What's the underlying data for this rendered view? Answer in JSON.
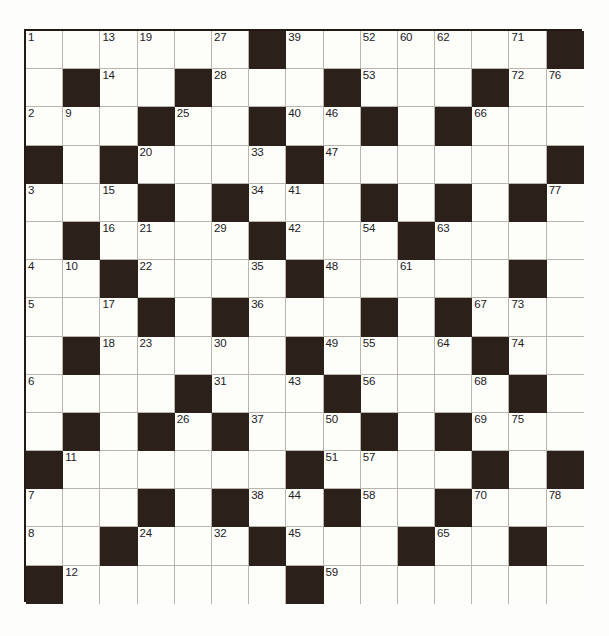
{
  "puzzle": {
    "type": "crossword-grid",
    "rows": 15,
    "columns": 15,
    "cell_size_px": 37,
    "colors": {
      "block": "#2b211a",
      "cell": "#fdfdfa",
      "grid_line": "#b9b4ac",
      "border": "#241a14",
      "number_text": "#23211f",
      "page_background": "#ffffff"
    },
    "number_range": {
      "min": 1,
      "max": 78
    },
    "grid": [
      [
        {
          "block": false,
          "number": "1"
        },
        {
          "block": false,
          "number": ""
        },
        {
          "block": false,
          "number": "13"
        },
        {
          "block": false,
          "number": "19"
        },
        {
          "block": false,
          "number": ""
        },
        {
          "block": false,
          "number": "27"
        },
        {
          "block": true,
          "number": ""
        },
        {
          "block": false,
          "number": "39"
        },
        {
          "block": false,
          "number": ""
        },
        {
          "block": false,
          "number": "52"
        },
        {
          "block": false,
          "number": "60"
        },
        {
          "block": false,
          "number": "62"
        },
        {
          "block": false,
          "number": ""
        },
        {
          "block": false,
          "number": "71"
        },
        {
          "block": true,
          "number": ""
        }
      ],
      [
        {
          "block": false,
          "number": ""
        },
        {
          "block": true,
          "number": ""
        },
        {
          "block": false,
          "number": "14"
        },
        {
          "block": false,
          "number": ""
        },
        {
          "block": true,
          "number": ""
        },
        {
          "block": false,
          "number": "28"
        },
        {
          "block": false,
          "number": ""
        },
        {
          "block": false,
          "number": ""
        },
        {
          "block": true,
          "number": ""
        },
        {
          "block": false,
          "number": "53"
        },
        {
          "block": false,
          "number": ""
        },
        {
          "block": false,
          "number": ""
        },
        {
          "block": true,
          "number": ""
        },
        {
          "block": false,
          "number": "72"
        },
        {
          "block": false,
          "number": "76"
        }
      ],
      [
        {
          "block": false,
          "number": "2"
        },
        {
          "block": false,
          "number": "9"
        },
        {
          "block": false,
          "number": ""
        },
        {
          "block": true,
          "number": ""
        },
        {
          "block": false,
          "number": "25"
        },
        {
          "block": false,
          "number": ""
        },
        {
          "block": true,
          "number": ""
        },
        {
          "block": false,
          "number": "40"
        },
        {
          "block": false,
          "number": "46"
        },
        {
          "block": true,
          "number": ""
        },
        {
          "block": false,
          "number": ""
        },
        {
          "block": true,
          "number": ""
        },
        {
          "block": false,
          "number": "66"
        },
        {
          "block": false,
          "number": ""
        },
        {
          "block": false,
          "number": ""
        }
      ],
      [
        {
          "block": true,
          "number": ""
        },
        {
          "block": false,
          "number": ""
        },
        {
          "block": true,
          "number": ""
        },
        {
          "block": false,
          "number": "20"
        },
        {
          "block": false,
          "number": ""
        },
        {
          "block": false,
          "number": ""
        },
        {
          "block": false,
          "number": "33"
        },
        {
          "block": true,
          "number": ""
        },
        {
          "block": false,
          "number": "47"
        },
        {
          "block": false,
          "number": ""
        },
        {
          "block": false,
          "number": ""
        },
        {
          "block": false,
          "number": ""
        },
        {
          "block": false,
          "number": ""
        },
        {
          "block": false,
          "number": ""
        },
        {
          "block": true,
          "number": ""
        }
      ],
      [
        {
          "block": false,
          "number": "3"
        },
        {
          "block": false,
          "number": ""
        },
        {
          "block": false,
          "number": "15"
        },
        {
          "block": true,
          "number": ""
        },
        {
          "block": false,
          "number": ""
        },
        {
          "block": true,
          "number": ""
        },
        {
          "block": false,
          "number": "34"
        },
        {
          "block": false,
          "number": "41"
        },
        {
          "block": false,
          "number": ""
        },
        {
          "block": true,
          "number": ""
        },
        {
          "block": false,
          "number": ""
        },
        {
          "block": true,
          "number": ""
        },
        {
          "block": false,
          "number": ""
        },
        {
          "block": true,
          "number": ""
        },
        {
          "block": false,
          "number": "77"
        }
      ],
      [
        {
          "block": false,
          "number": ""
        },
        {
          "block": true,
          "number": ""
        },
        {
          "block": false,
          "number": "16"
        },
        {
          "block": false,
          "number": "21"
        },
        {
          "block": false,
          "number": ""
        },
        {
          "block": false,
          "number": "29"
        },
        {
          "block": true,
          "number": ""
        },
        {
          "block": false,
          "number": "42"
        },
        {
          "block": false,
          "number": ""
        },
        {
          "block": false,
          "number": "54"
        },
        {
          "block": true,
          "number": ""
        },
        {
          "block": false,
          "number": "63"
        },
        {
          "block": false,
          "number": ""
        },
        {
          "block": false,
          "number": ""
        },
        {
          "block": false,
          "number": ""
        }
      ],
      [
        {
          "block": false,
          "number": "4"
        },
        {
          "block": false,
          "number": "10"
        },
        {
          "block": true,
          "number": ""
        },
        {
          "block": false,
          "number": "22"
        },
        {
          "block": false,
          "number": ""
        },
        {
          "block": false,
          "number": ""
        },
        {
          "block": false,
          "number": "35"
        },
        {
          "block": true,
          "number": ""
        },
        {
          "block": false,
          "number": "48"
        },
        {
          "block": false,
          "number": ""
        },
        {
          "block": false,
          "number": "61"
        },
        {
          "block": false,
          "number": ""
        },
        {
          "block": false,
          "number": ""
        },
        {
          "block": true,
          "number": ""
        },
        {
          "block": false,
          "number": ""
        }
      ],
      [
        {
          "block": false,
          "number": "5"
        },
        {
          "block": false,
          "number": ""
        },
        {
          "block": false,
          "number": "17"
        },
        {
          "block": true,
          "number": ""
        },
        {
          "block": false,
          "number": ""
        },
        {
          "block": true,
          "number": ""
        },
        {
          "block": false,
          "number": "36"
        },
        {
          "block": false,
          "number": ""
        },
        {
          "block": false,
          "number": ""
        },
        {
          "block": true,
          "number": ""
        },
        {
          "block": false,
          "number": ""
        },
        {
          "block": true,
          "number": ""
        },
        {
          "block": false,
          "number": "67"
        },
        {
          "block": false,
          "number": "73"
        },
        {
          "block": false,
          "number": ""
        }
      ],
      [
        {
          "block": false,
          "number": ""
        },
        {
          "block": true,
          "number": ""
        },
        {
          "block": false,
          "number": "18"
        },
        {
          "block": false,
          "number": "23"
        },
        {
          "block": false,
          "number": ""
        },
        {
          "block": false,
          "number": "30"
        },
        {
          "block": false,
          "number": ""
        },
        {
          "block": true,
          "number": ""
        },
        {
          "block": false,
          "number": "49"
        },
        {
          "block": false,
          "number": "55"
        },
        {
          "block": false,
          "number": ""
        },
        {
          "block": false,
          "number": "64"
        },
        {
          "block": true,
          "number": ""
        },
        {
          "block": false,
          "number": "74"
        },
        {
          "block": false,
          "number": ""
        }
      ],
      [
        {
          "block": false,
          "number": "6"
        },
        {
          "block": false,
          "number": ""
        },
        {
          "block": false,
          "number": ""
        },
        {
          "block": false,
          "number": ""
        },
        {
          "block": true,
          "number": ""
        },
        {
          "block": false,
          "number": "31"
        },
        {
          "block": false,
          "number": ""
        },
        {
          "block": false,
          "number": "43"
        },
        {
          "block": true,
          "number": ""
        },
        {
          "block": false,
          "number": "56"
        },
        {
          "block": false,
          "number": ""
        },
        {
          "block": false,
          "number": ""
        },
        {
          "block": false,
          "number": "68"
        },
        {
          "block": true,
          "number": ""
        },
        {
          "block": false,
          "number": ""
        }
      ],
      [
        {
          "block": false,
          "number": ""
        },
        {
          "block": true,
          "number": ""
        },
        {
          "block": false,
          "number": ""
        },
        {
          "block": true,
          "number": ""
        },
        {
          "block": false,
          "number": "26"
        },
        {
          "block": true,
          "number": ""
        },
        {
          "block": false,
          "number": "37"
        },
        {
          "block": false,
          "number": ""
        },
        {
          "block": false,
          "number": "50"
        },
        {
          "block": true,
          "number": ""
        },
        {
          "block": false,
          "number": ""
        },
        {
          "block": true,
          "number": ""
        },
        {
          "block": false,
          "number": "69"
        },
        {
          "block": false,
          "number": "75"
        },
        {
          "block": false,
          "number": ""
        }
      ],
      [
        {
          "block": true,
          "number": ""
        },
        {
          "block": false,
          "number": "11"
        },
        {
          "block": false,
          "number": ""
        },
        {
          "block": false,
          "number": ""
        },
        {
          "block": false,
          "number": ""
        },
        {
          "block": false,
          "number": ""
        },
        {
          "block": false,
          "number": ""
        },
        {
          "block": true,
          "number": ""
        },
        {
          "block": false,
          "number": "51"
        },
        {
          "block": false,
          "number": "57"
        },
        {
          "block": false,
          "number": ""
        },
        {
          "block": false,
          "number": ""
        },
        {
          "block": true,
          "number": ""
        },
        {
          "block": false,
          "number": ""
        },
        {
          "block": true,
          "number": ""
        }
      ],
      [
        {
          "block": false,
          "number": "7"
        },
        {
          "block": false,
          "number": ""
        },
        {
          "block": false,
          "number": ""
        },
        {
          "block": true,
          "number": ""
        },
        {
          "block": false,
          "number": ""
        },
        {
          "block": true,
          "number": ""
        },
        {
          "block": false,
          "number": "38"
        },
        {
          "block": false,
          "number": "44"
        },
        {
          "block": true,
          "number": ""
        },
        {
          "block": false,
          "number": "58"
        },
        {
          "block": false,
          "number": ""
        },
        {
          "block": true,
          "number": ""
        },
        {
          "block": false,
          "number": "70"
        },
        {
          "block": false,
          "number": ""
        },
        {
          "block": false,
          "number": "78"
        }
      ],
      [
        {
          "block": false,
          "number": "8"
        },
        {
          "block": false,
          "number": ""
        },
        {
          "block": true,
          "number": ""
        },
        {
          "block": false,
          "number": "24"
        },
        {
          "block": false,
          "number": ""
        },
        {
          "block": false,
          "number": "32"
        },
        {
          "block": true,
          "number": ""
        },
        {
          "block": false,
          "number": "45"
        },
        {
          "block": false,
          "number": ""
        },
        {
          "block": false,
          "number": ""
        },
        {
          "block": true,
          "number": ""
        },
        {
          "block": false,
          "number": "65"
        },
        {
          "block": false,
          "number": ""
        },
        {
          "block": true,
          "number": ""
        },
        {
          "block": false,
          "number": ""
        }
      ],
      [
        {
          "block": true,
          "number": ""
        },
        {
          "block": false,
          "number": "12"
        },
        {
          "block": false,
          "number": ""
        },
        {
          "block": false,
          "number": ""
        },
        {
          "block": false,
          "number": ""
        },
        {
          "block": false,
          "number": ""
        },
        {
          "block": false,
          "number": ""
        },
        {
          "block": true,
          "number": ""
        },
        {
          "block": false,
          "number": "59"
        },
        {
          "block": false,
          "number": ""
        },
        {
          "block": false,
          "number": ""
        },
        {
          "block": false,
          "number": ""
        },
        {
          "block": false,
          "number": ""
        },
        {
          "block": false,
          "number": ""
        },
        {
          "block": false,
          "number": ""
        }
      ]
    ]
  }
}
